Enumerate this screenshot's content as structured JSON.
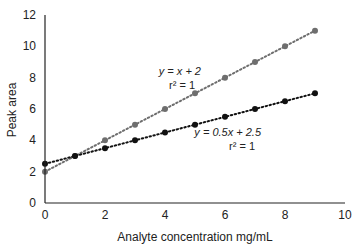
{
  "chart_data": {
    "type": "scatter",
    "title": "",
    "xlabel": "Analyte concentration mg/mL",
    "ylabel": "Peak area",
    "xlim": [
      0,
      10
    ],
    "ylim": [
      0,
      12
    ],
    "xticks": [
      0,
      2,
      4,
      6,
      8,
      10
    ],
    "yticks": [
      0,
      2,
      4,
      6,
      8,
      10,
      12
    ],
    "grid": false,
    "legend": "none",
    "series": [
      {
        "name": "y = x + 2",
        "color": "#6e6e6e",
        "x": [
          0,
          1,
          2,
          3,
          4,
          5,
          6,
          7,
          8,
          9
        ],
        "y": [
          2,
          3,
          4,
          5,
          6,
          7,
          8,
          9,
          10,
          11
        ],
        "equation": "y = x + 2",
        "r2": "r² = 1"
      },
      {
        "name": "y = 0.5x + 2.5",
        "color": "#111111",
        "x": [
          0,
          1,
          2,
          3,
          4,
          5,
          6,
          7,
          8,
          9
        ],
        "y": [
          2.5,
          3,
          3.5,
          4,
          4.5,
          5,
          5.5,
          6,
          6.5,
          7
        ],
        "equation": "y = 0.5x + 2.5",
        "r2": "r² = 1"
      }
    ],
    "annotations": [
      {
        "text": "y = x + 2",
        "line2": "r² = 1",
        "x": 5.2,
        "y": 8.2
      },
      {
        "text": "y = 0.5x + 2.5",
        "line2": "r² = 1",
        "x": 7.2,
        "y": 4.3
      }
    ]
  }
}
